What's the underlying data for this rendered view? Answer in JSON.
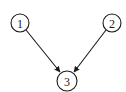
{
  "diagram": {
    "type": "directed-graph",
    "nodes": [
      {
        "id": "1",
        "label": "1",
        "cx": 20,
        "cy": 23,
        "r": 9
      },
      {
        "id": "2",
        "label": "2",
        "cx": 112,
        "cy": 23,
        "r": 9
      },
      {
        "id": "3",
        "label": "3",
        "cx": 67,
        "cy": 81,
        "r": 10
      }
    ],
    "edges": [
      {
        "from": "1",
        "to": "3"
      },
      {
        "from": "2",
        "to": "3"
      }
    ],
    "colors": {
      "stroke": "#1a1a1a",
      "background": "#ffffff"
    }
  }
}
